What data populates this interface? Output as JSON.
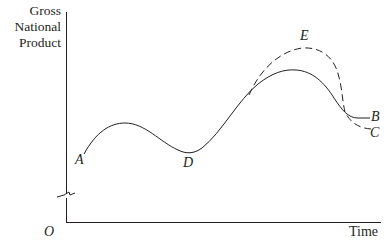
{
  "diagram": {
    "type": "business-cycle-line-graph",
    "y_axis_label_lines": [
      "Gross",
      "National",
      "Product"
    ],
    "x_axis_label": "Time",
    "origin_label": "O",
    "axis_break": true,
    "points": {
      "A": {
        "label": "A",
        "description": "start of solid curve"
      },
      "D": {
        "label": "D",
        "description": "trough of solid curve"
      },
      "E": {
        "label": "E",
        "description": "peak of dashed curve"
      },
      "B": {
        "label": "B",
        "description": "end of solid curve"
      },
      "C": {
        "label": "C",
        "description": "end of dashed curve"
      }
    },
    "series": [
      {
        "name": "solid-path",
        "style": "solid",
        "through": [
          "A",
          "peak",
          "D",
          "peak",
          "B"
        ]
      },
      {
        "name": "dashed-path",
        "style": "dashed",
        "through": [
          "E",
          "C"
        ]
      }
    ],
    "colors": {
      "line": "#231f20",
      "background": "#ffffff"
    }
  }
}
